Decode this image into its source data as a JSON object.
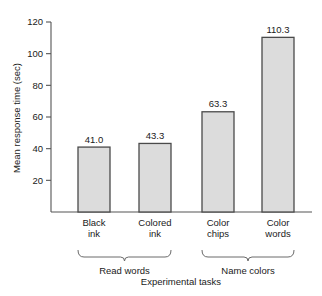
{
  "chart_data": {
    "type": "bar",
    "title": "",
    "subtitle": "",
    "xlabel": "Experimental tasks",
    "ylabel": "Mean response time (sec)",
    "categories": [
      "Black ink",
      "Colored ink",
      "Color chips",
      "Color words"
    ],
    "category_lines": [
      [
        "Black",
        "ink"
      ],
      [
        "Colored",
        "ink"
      ],
      [
        "Color",
        "chips"
      ],
      [
        "Color",
        "words"
      ]
    ],
    "values": [
      41.0,
      43.3,
      63.3,
      110.3
    ],
    "value_labels": [
      "41.0",
      "43.3",
      "63.3",
      "110.3"
    ],
    "ylim": [
      0,
      120
    ],
    "yticks": [
      20,
      40,
      60,
      80,
      100,
      120
    ],
    "ytick_labels": [
      "20",
      "40",
      "60",
      "80",
      "100",
      "120"
    ],
    "grid": false,
    "legend": "none",
    "groups": [
      {
        "label": "Read words",
        "categories": [
          "Black ink",
          "Colored ink"
        ]
      },
      {
        "label": "Name colors",
        "categories": [
          "Color chips",
          "Color words"
        ]
      }
    ],
    "colors": {
      "bar_fill": "#dcdcdc",
      "bar_stroke": "#4a4a4a",
      "axis": "#555555",
      "text": "#1a1a1a",
      "background": "#ffffff"
    }
  }
}
